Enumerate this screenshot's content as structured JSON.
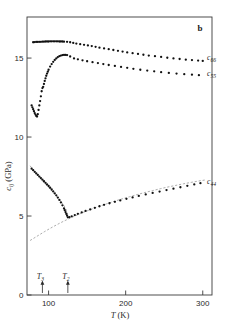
{
  "panel": {
    "label": "b"
  },
  "axes": {
    "x": {
      "title_var": "T",
      "title_unit": "(K)",
      "ticks": [
        100,
        200,
        300
      ],
      "tick_labels": [
        "100",
        "200",
        "300"
      ],
      "min": 72,
      "max": 312
    },
    "y": {
      "title_var": "c",
      "title_sub": "ij",
      "title_unit": "(GPa)",
      "ticks": [
        0,
        5,
        10,
        15
      ],
      "tick_labels": [
        "0",
        "5",
        "10",
        "15"
      ],
      "min": 0,
      "max": 17.6
    }
  },
  "markers": [
    {
      "name": "T3",
      "var": "T",
      "sub": "3",
      "value": 92
    },
    {
      "name": "T2",
      "var": "T",
      "sub": "2",
      "value": 125
    }
  ],
  "chart_data": {
    "type": "scatter",
    "title": "",
    "xlabel": "T (K)",
    "ylabel": "c_ij (GPa)",
    "xlim": [
      72,
      312
    ],
    "ylim": [
      0,
      17.6
    ],
    "grid": false,
    "legend": "inline-right",
    "series": [
      {
        "name": "c66",
        "label_var": "c",
        "label_sub": "66",
        "label_x": 303,
        "label_y": 15.05,
        "points": [
          [
            80,
            16.0
          ],
          [
            82,
            16.01
          ],
          [
            84,
            16.02
          ],
          [
            86,
            16.02
          ],
          [
            88,
            16.03
          ],
          [
            90,
            16.03
          ],
          [
            92,
            16.04
          ],
          [
            94,
            16.04
          ],
          [
            96,
            16.05
          ],
          [
            98,
            16.05
          ],
          [
            100,
            16.05
          ],
          [
            102,
            16.06
          ],
          [
            104,
            16.06
          ],
          [
            106,
            16.06
          ],
          [
            108,
            16.06
          ],
          [
            110,
            16.06
          ],
          [
            112,
            16.06
          ],
          [
            114,
            16.05
          ],
          [
            116,
            16.05
          ],
          [
            118,
            16.05
          ],
          [
            120,
            16.04
          ],
          [
            124,
            16.03
          ],
          [
            128,
            16.0
          ],
          [
            132,
            15.96
          ],
          [
            136,
            15.92
          ],
          [
            141,
            15.88
          ],
          [
            146,
            15.84
          ],
          [
            151,
            15.8
          ],
          [
            156,
            15.76
          ],
          [
            161,
            15.71
          ],
          [
            166,
            15.66
          ],
          [
            172,
            15.61
          ],
          [
            178,
            15.56
          ],
          [
            184,
            15.51
          ],
          [
            190,
            15.46
          ],
          [
            196,
            15.41
          ],
          [
            202,
            15.36
          ],
          [
            209,
            15.31
          ],
          [
            216,
            15.26
          ],
          [
            223,
            15.21
          ],
          [
            230,
            15.16
          ],
          [
            238,
            15.12
          ],
          [
            246,
            15.07
          ],
          [
            254,
            15.02
          ],
          [
            262,
            14.98
          ],
          [
            270,
            14.94
          ],
          [
            278,
            14.9
          ],
          [
            286,
            14.87
          ],
          [
            294,
            14.84
          ],
          [
            300,
            14.82
          ]
        ]
      },
      {
        "name": "c55",
        "label_var": "c",
        "label_sub": "55",
        "label_x": 303,
        "label_y": 14.05,
        "points": [
          [
            78,
            12.0
          ],
          [
            79,
            11.88
          ],
          [
            80,
            11.76
          ],
          [
            81,
            11.64
          ],
          [
            82,
            11.52
          ],
          [
            83,
            11.42
          ],
          [
            84,
            11.34
          ],
          [
            85,
            11.3
          ],
          [
            86,
            11.45
          ],
          [
            87,
            11.72
          ],
          [
            88,
            12.0
          ],
          [
            89,
            12.28
          ],
          [
            90,
            12.58
          ],
          [
            91,
            12.9
          ],
          [
            92,
            13.1
          ],
          [
            93,
            13.18
          ],
          [
            94,
            13.36
          ],
          [
            95,
            13.55
          ],
          [
            96,
            13.72
          ],
          [
            97,
            13.88
          ],
          [
            98,
            14.02
          ],
          [
            99,
            14.14
          ],
          [
            100,
            14.26
          ],
          [
            102,
            14.46
          ],
          [
            104,
            14.62
          ],
          [
            106,
            14.76
          ],
          [
            108,
            14.88
          ],
          [
            110,
            14.98
          ],
          [
            112,
            15.06
          ],
          [
            114,
            15.12
          ],
          [
            116,
            15.16
          ],
          [
            118,
            15.19
          ],
          [
            120,
            15.2
          ],
          [
            122,
            15.2
          ],
          [
            124,
            15.19
          ],
          [
            128,
            15.1
          ],
          [
            133,
            14.98
          ],
          [
            138,
            14.92
          ],
          [
            144,
            14.86
          ],
          [
            150,
            14.8
          ],
          [
            157,
            14.74
          ],
          [
            164,
            14.68
          ],
          [
            171,
            14.62
          ],
          [
            178,
            14.56
          ],
          [
            186,
            14.5
          ],
          [
            194,
            14.44
          ],
          [
            202,
            14.38
          ],
          [
            210,
            14.32
          ],
          [
            219,
            14.26
          ],
          [
            228,
            14.21
          ],
          [
            237,
            14.16
          ],
          [
            246,
            14.11
          ],
          [
            256,
            14.06
          ],
          [
            266,
            14.02
          ],
          [
            276,
            13.98
          ],
          [
            286,
            13.95
          ],
          [
            295,
            13.92
          ]
        ]
      },
      {
        "name": "c44",
        "label_var": "c",
        "label_sub": "44",
        "label_x": 303,
        "label_y": 7.18,
        "points": [
          [
            78,
            8.0
          ],
          [
            80,
            7.9
          ],
          [
            82,
            7.8
          ],
          [
            84,
            7.7
          ],
          [
            86,
            7.6
          ],
          [
            88,
            7.5
          ],
          [
            90,
            7.4
          ],
          [
            92,
            7.3
          ],
          [
            94,
            7.2
          ],
          [
            96,
            7.1
          ],
          [
            98,
            7.0
          ],
          [
            100,
            6.9
          ],
          [
            102,
            6.79
          ],
          [
            104,
            6.68
          ],
          [
            106,
            6.56
          ],
          [
            108,
            6.44
          ],
          [
            110,
            6.31
          ],
          [
            112,
            6.17
          ],
          [
            114,
            6.02
          ],
          [
            116,
            5.86
          ],
          [
            118,
            5.68
          ],
          [
            120,
            5.48
          ],
          [
            121,
            5.37
          ],
          [
            122,
            5.25
          ],
          [
            123,
            5.13
          ],
          [
            124,
            5.02
          ],
          [
            125,
            4.92
          ],
          [
            127,
            4.93
          ],
          [
            130,
            4.98
          ],
          [
            134,
            5.06
          ],
          [
            138,
            5.14
          ],
          [
            143,
            5.23
          ],
          [
            148,
            5.32
          ],
          [
            154,
            5.42
          ],
          [
            160,
            5.52
          ],
          [
            166,
            5.62
          ],
          [
            172,
            5.71
          ],
          [
            179,
            5.81
          ],
          [
            186,
            5.9
          ],
          [
            193,
            5.99
          ],
          [
            201,
            6.09
          ],
          [
            209,
            6.18
          ],
          [
            217,
            6.27
          ],
          [
            226,
            6.37
          ],
          [
            235,
            6.46
          ],
          [
            244,
            6.55
          ],
          [
            253,
            6.64
          ],
          [
            262,
            6.73
          ],
          [
            271,
            6.82
          ],
          [
            280,
            6.91
          ],
          [
            289,
            7.0
          ],
          [
            297,
            7.08
          ]
        ]
      }
    ],
    "dashed_curve": {
      "name": "c44-extrapolation",
      "points": [
        [
          76,
          3.45
        ],
        [
          85,
          3.72
        ],
        [
          95,
          4.02
        ],
        [
          105,
          4.3
        ],
        [
          115,
          4.56
        ],
        [
          125,
          4.8
        ],
        [
          135,
          5.02
        ],
        [
          145,
          5.23
        ],
        [
          155,
          5.42
        ],
        [
          165,
          5.6
        ],
        [
          175,
          5.77
        ],
        [
          185,
          5.93
        ],
        [
          195,
          6.08
        ],
        [
          205,
          6.22
        ],
        [
          215,
          6.36
        ],
        [
          225,
          6.49
        ],
        [
          235,
          6.61
        ],
        [
          245,
          6.73
        ],
        [
          255,
          6.84
        ],
        [
          265,
          6.94
        ],
        [
          275,
          7.04
        ],
        [
          285,
          7.13
        ],
        [
          295,
          7.22
        ],
        [
          303,
          7.28
        ]
      ]
    },
    "dashed_curve_upper": {
      "name": "c44-upper-extrapolation",
      "points": [
        [
          76,
          8.18
        ],
        [
          80,
          7.92
        ],
        [
          85,
          7.62
        ],
        [
          90,
          7.34
        ],
        [
          95,
          7.06
        ],
        [
          100,
          6.8
        ],
        [
          105,
          6.54
        ],
        [
          110,
          6.28
        ],
        [
          115,
          6.0
        ],
        [
          120,
          5.66
        ],
        [
          123,
          5.38
        ],
        [
          125,
          5.05
        ]
      ]
    }
  }
}
